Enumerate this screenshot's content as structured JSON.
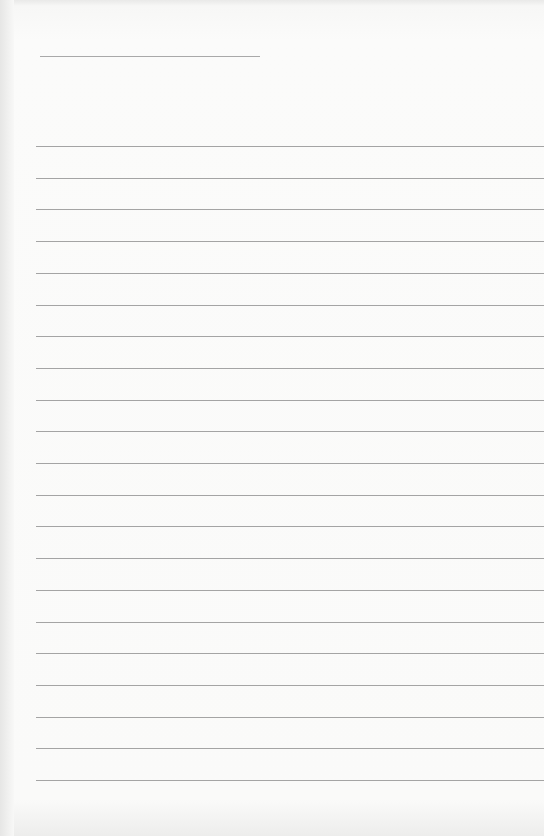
{
  "page": {
    "type": "lined-paper",
    "background_color": "#fafaf9",
    "line_color": "#a4a4a4",
    "title_line": {
      "left": 40,
      "top": 56,
      "width": 220
    },
    "rules": {
      "count": 21,
      "first_top": 146,
      "spacing": 31.7,
      "left": 36
    }
  }
}
